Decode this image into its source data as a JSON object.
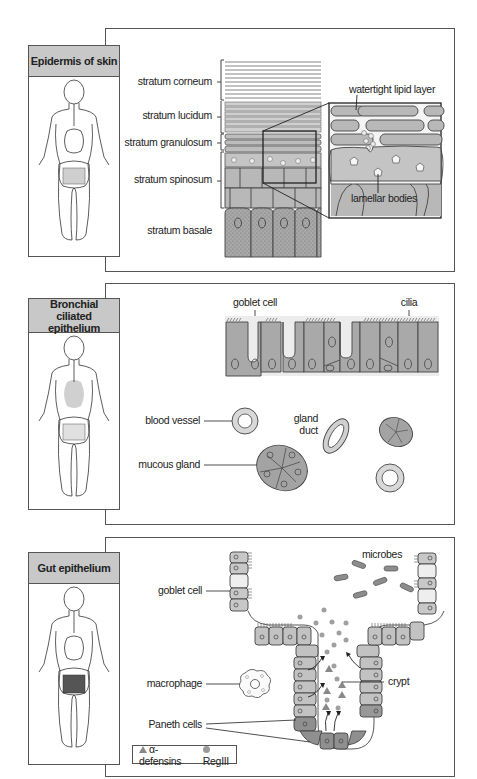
{
  "panels": [
    {
      "id": "skin",
      "title": "Epidermis of skin",
      "labels": {
        "stratum_corneum": "stratum corneum",
        "stratum_lucidum": "stratum lucidum",
        "stratum_granulosum": "stratum granulosum",
        "stratum_spinosum": "stratum spinosum",
        "stratum_basale": "stratum basale",
        "lipid_layer": "watertight lipid layer",
        "lamellar_bodies": "lamellar bodies"
      }
    },
    {
      "id": "bronchial",
      "title_line1": "Bronchial",
      "title_line2": "ciliated epithelium",
      "labels": {
        "goblet_cell": "goblet cell",
        "cilia": "cilia",
        "blood_vessel": "blood vessel",
        "gland_duct_1": "gland",
        "gland_duct_2": "duct",
        "mucous_gland": "mucous gland"
      }
    },
    {
      "id": "gut",
      "title": "Gut epithelium",
      "labels": {
        "goblet_cell": "goblet cell",
        "microbes": "microbes",
        "macrophage": "macrophage",
        "crypt": "crypt",
        "paneth_cells": "Paneth cells"
      },
      "legend": [
        {
          "symbol": "triangle",
          "label": "α-defensins"
        },
        {
          "symbol": "circle",
          "label": "RegIII"
        }
      ]
    }
  ],
  "colors": {
    "cell_fill": "#b4b4b4",
    "cell_fill_light": "#d2d2d2",
    "cell_fill_dark": "#8c8c8c",
    "header_fill": "#c8c8c8",
    "stroke": "#444444"
  }
}
